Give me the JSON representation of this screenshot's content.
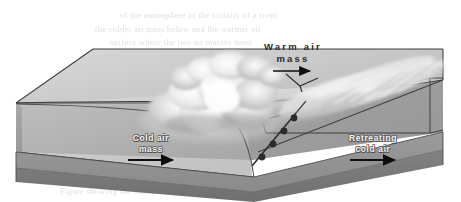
{
  "figure": {
    "type": "meteorological-diagram",
    "width": 461,
    "height": 202,
    "palette": {
      "page_background": "#ffffff",
      "sky_upper": "#e3e3e3",
      "sky_mid": "#d2d2d2",
      "warm_air_slab_top": "#cfcfcf",
      "cold_air_wedge": "#b4b4b4",
      "ground_surface": "#a8a8a8",
      "ground_right": "#9c9c9c",
      "block_front_face": "#8f8f8f",
      "block_base_slab": "#7a7a7a",
      "block_left_face": "#9a9a9a",
      "outline_stroke": "#3b3b3b",
      "cloud_highlight": "#fbfbfb",
      "cloud_shadow": "#9a9a9a",
      "front_symbol_fill": "#2e2e2e",
      "arrow_dark": "#111111",
      "label_light": "#f2f2f2"
    }
  },
  "labels": {
    "warm_air": {
      "line1": "Warm air",
      "line2": "mass",
      "name": "warm-air-mass-label"
    },
    "cold_air": {
      "line1": "Cold air",
      "line2": "mass",
      "name": "cold-air-mass-label"
    },
    "retreating_cold_air": {
      "line1": "Retreating",
      "line2": "cold air",
      "name": "retreating-cold-air-label"
    }
  },
  "arrows": {
    "warm_air_flow": {
      "direction": "right",
      "meaning": "warm air mass advancing"
    },
    "cold_air_flow": {
      "direction": "right",
      "meaning": "cold air mass motion"
    },
    "retreating_cold_flow": {
      "direction": "right",
      "meaning": "retreating cold air motion"
    }
  },
  "front_symbols": {
    "type": "warm-front",
    "glyph": "semicircle",
    "count": 4,
    "description": "Rounded half-circle bumps along the surface front line"
  },
  "clouds": [
    {
      "name": "cumulonimbus-cloud",
      "description": "Large billowing convective cloud mass over the frontal slope"
    },
    {
      "name": "cirrostratus-cloud",
      "description": "Streaked high cloud deck trailing up and to the right"
    }
  ],
  "ghost_text": {
    "note": "Faint show-through text from the reverse of the printed page; illegible",
    "lines": [
      "of the atmosphere in the vicinity of a front",
      "the colder air mass below and the warmer air",
      "surface where the two air masses meet"
    ],
    "bottom_lines": [
      "Figure showing the frontal surface and the associated cloud"
    ]
  }
}
